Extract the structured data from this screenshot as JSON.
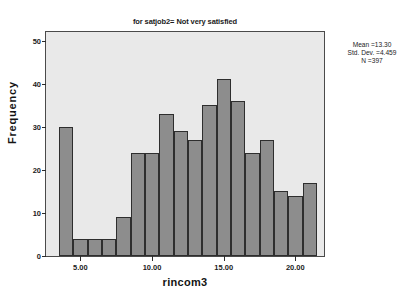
{
  "chart_data": {
    "type": "bar",
    "title": "for satjob2= Not very satisfied",
    "xlabel": "rincom3",
    "ylabel": "Frequency",
    "xlim": [
      2.6,
      22.0
    ],
    "ylim": [
      0,
      52
    ],
    "grid": false,
    "legend": null,
    "bin_width": 1,
    "categories": [
      "4",
      "5",
      "6",
      "7",
      "8",
      "9",
      "10",
      "11",
      "12",
      "13",
      "14",
      "15",
      "16",
      "17",
      "18",
      "19",
      "20",
      "21"
    ],
    "bin_starts": [
      3.5,
      4.5,
      5.5,
      6.5,
      7.5,
      8.5,
      9.5,
      10.5,
      11.5,
      12.5,
      13.5,
      14.5,
      15.5,
      16.5,
      17.5,
      18.5,
      19.5,
      20.5
    ],
    "values": [
      30,
      4,
      4,
      4,
      9,
      24,
      24,
      33,
      29,
      27,
      35,
      41,
      36,
      24,
      27,
      15,
      14,
      17
    ],
    "xticks": [
      5,
      10,
      15,
      20
    ],
    "xtick_labels": [
      "5.00",
      "10.00",
      "15.00",
      "20.00"
    ],
    "yticks": [
      0,
      10,
      20,
      30,
      40,
      50
    ],
    "ytick_labels": [
      "0",
      "10",
      "20",
      "30",
      "40",
      "50"
    ],
    "annotations": {
      "mean": "Mean =13.30",
      "std_dev": "Std. Dev. =4.459",
      "n": "N =397"
    },
    "colors": {
      "bar_fill": "#8d8d8d",
      "bar_edge": "#2e2e2e",
      "plot_background": "#e9e9e9",
      "frame": "#4a4a4a",
      "text": "#1b1b1b",
      "figure_background": "#ffffff"
    }
  }
}
